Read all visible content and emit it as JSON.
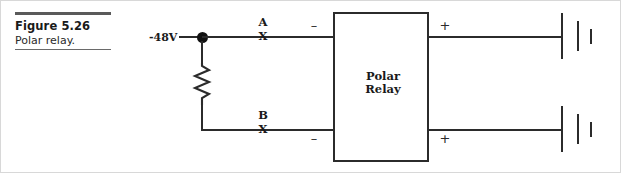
{
  "caption": {
    "figure_number": "Figure 5.26",
    "title": "Polar relay."
  },
  "schematic": {
    "source_label": "-48V",
    "relay_label": "Polar\nRelay",
    "contacts": [
      {
        "name": "A",
        "state": "X"
      },
      {
        "name": "B",
        "state": "X"
      }
    ],
    "polarity": {
      "top_left": "–",
      "top_right": "+",
      "bottom_left": "–",
      "bottom_right": "+"
    },
    "components": {
      "resistor": "resistor",
      "junction": "junction-dot",
      "top_terminal": "battery-cell",
      "bottom_terminal": "battery-cell"
    }
  },
  "colors": {
    "wire": "#2b2b2b",
    "text": "#1a1a1a",
    "rule": "#5a5a5a",
    "page_border": "#d8d8d8"
  }
}
